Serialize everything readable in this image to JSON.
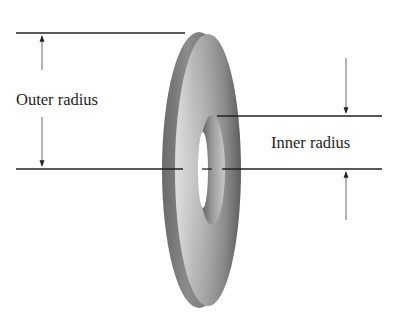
{
  "diagram": {
    "type": "annotated-illustration",
    "labels": {
      "outer_radius": "Outer radius",
      "inner_radius": "Inner radius"
    },
    "colors": {
      "background": "#ffffff",
      "line": "#222222",
      "arrow": "#555555",
      "disc_dark": "#5a5a5a",
      "disc_mid": "#8a8a8a",
      "disc_light": "#d8d8d8"
    }
  }
}
